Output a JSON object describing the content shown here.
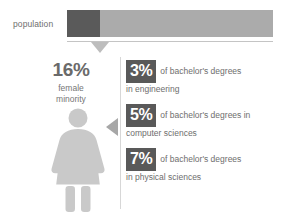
{
  "chart_data": {
    "type": "bar",
    "title": "",
    "orientation": "horizontal",
    "stacked": true,
    "categories": [
      "population"
    ],
    "series": [
      {
        "name": "female minority",
        "values": [
          16
        ],
        "color": "#5a5a5a"
      },
      {
        "name": "remainder",
        "values": [
          84
        ],
        "color": "#ababab"
      }
    ],
    "unit": "%",
    "xlim": [
      0,
      100
    ],
    "grid": false,
    "legend": "none",
    "annotations": [
      {
        "value": 16,
        "label": "16%",
        "caption": "female minority"
      }
    ],
    "secondary_stats": [
      {
        "value": 3,
        "label": "3%",
        "text": "of bachelor's degrees in engineering"
      },
      {
        "value": 5,
        "label": "5%",
        "text": "of bachelor's degrees in computer sciences"
      },
      {
        "value": 7,
        "label": "7%",
        "text": "of bachelor's degrees in physical sciences"
      }
    ]
  },
  "bar": {
    "row_label": "population",
    "female_width_pct": "16%",
    "other_width_pct": "84%",
    "dark_color": "#5a5a5a",
    "light_color": "#ababab"
  },
  "callout": {
    "percent": "16%",
    "caption_line1": "female",
    "caption_line2": "minority"
  },
  "stats": [
    {
      "percent": "3%",
      "line1": "of bachelor's degrees",
      "line2": "in engineering"
    },
    {
      "percent": "5%",
      "line1": "of bachelor's degrees in",
      "line2": "computer sciences"
    },
    {
      "percent": "7%",
      "line1": "of bachelor's degrees",
      "line2": "in physical sciences"
    }
  ],
  "icons": {
    "female_figure": "female-figure-icon",
    "bar_pointer": "triangle-down-icon",
    "stat_marker": "triangle-left-icon"
  }
}
